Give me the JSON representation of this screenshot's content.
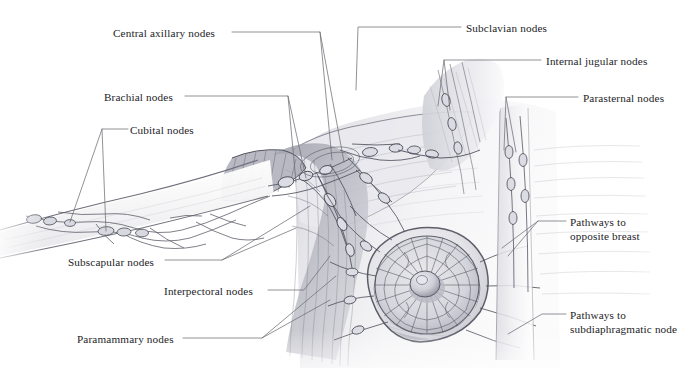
{
  "figure": {
    "background_color": "#ffffff",
    "ink_color": "#4a4a52",
    "text_color": "#1d1d1f",
    "leader_color": "#6e6e76",
    "width": 683,
    "height": 368
  },
  "labels": [
    {
      "id": "central-axillary-nodes",
      "text": "Central axillary nodes",
      "x": 113,
      "y": 27,
      "align": "left"
    },
    {
      "id": "brachial-nodes",
      "text": "Brachial nodes",
      "x": 104,
      "y": 91,
      "align": "left"
    },
    {
      "id": "cubital-nodes",
      "text": "Cubital nodes",
      "x": 130,
      "y": 124,
      "align": "left"
    },
    {
      "id": "subscapular-nodes",
      "text": "Subscapular nodes",
      "x": 68,
      "y": 256,
      "align": "left"
    },
    {
      "id": "interpectoral-nodes",
      "text": "Interpectoral nodes",
      "x": 164,
      "y": 285,
      "align": "left"
    },
    {
      "id": "paramammary-nodes",
      "text": "Paramammary nodes",
      "x": 77,
      "y": 333,
      "align": "left"
    },
    {
      "id": "subclavian-nodes",
      "text": "Subclavian nodes",
      "x": 466,
      "y": 22,
      "align": "left"
    },
    {
      "id": "internal-jugular-nodes",
      "text": "Internal jugular nodes",
      "x": 546,
      "y": 55,
      "align": "left"
    },
    {
      "id": "parasternal-nodes",
      "text": "Parasternal nodes",
      "x": 583,
      "y": 92,
      "align": "left"
    },
    {
      "id": "pathways-to-opposite-breast",
      "text": "Pathways to\nopposite breast",
      "x": 570,
      "y": 216,
      "align": "left"
    },
    {
      "id": "pathways-to-subdiaphragmatic-node",
      "text": "Pathways to\nsubdiaphragmatic node",
      "x": 570,
      "y": 309,
      "align": "left"
    }
  ],
  "anatomy_parts": [
    {
      "id": "upper-arm",
      "name": "upper arm with superficial lymphatic vessels"
    },
    {
      "id": "axilla",
      "name": "axillary lymph node network"
    },
    {
      "id": "pectoral-region",
      "name": "pectoral muscle region"
    },
    {
      "id": "breast",
      "name": "breast with areola and nipple"
    },
    {
      "id": "areolar-plexus",
      "name": "subareolar lymphatic plexus"
    },
    {
      "id": "nipple",
      "name": "nipple"
    },
    {
      "id": "sternum",
      "name": "sternum and parasternal chain"
    },
    {
      "id": "clavicle",
      "name": "clavicle region"
    },
    {
      "id": "neck",
      "name": "neck with internal jugular chain"
    },
    {
      "id": "rib-cage",
      "name": "lower rib cage / subdiaphragmatic pathways"
    }
  ]
}
